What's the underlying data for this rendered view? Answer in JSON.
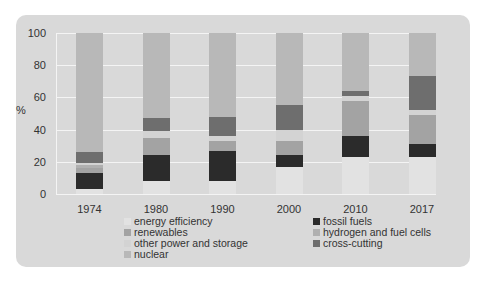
{
  "chart_data": {
    "type": "bar",
    "stacked": true,
    "title": "",
    "xlabel": "",
    "ylabel": "%",
    "ylim": [
      0,
      100
    ],
    "yticks": [
      "0",
      "20",
      "40",
      "60",
      "80",
      "100"
    ],
    "grid": true,
    "legend_position": "bottom",
    "categories": [
      "1974",
      "1980",
      "1990",
      "2000",
      "2010",
      "2017"
    ],
    "series": [
      {
        "name": "energy efficiency",
        "color": "#e2e2e2",
        "values": [
          3,
          8,
          8,
          17,
          23,
          23
        ]
      },
      {
        "name": "fossil fuels",
        "color": "#2b2b2b",
        "values": [
          10,
          16,
          19,
          7,
          13,
          8
        ]
      },
      {
        "name": "renewables",
        "color": "#a3a3a3",
        "values": [
          3,
          11,
          6,
          9,
          22,
          18
        ]
      },
      {
        "name": "hydrogen and fuel cells",
        "color": "#b0b0b0",
        "values": [
          2,
          0,
          0,
          0,
          0,
          0
        ]
      },
      {
        "name": "other power and storage",
        "color": "#d3d3d3",
        "values": [
          1,
          4,
          3,
          7,
          3,
          3
        ]
      },
      {
        "name": "cross-cutting",
        "color": "#6e6e6e",
        "values": [
          7,
          8,
          12,
          15,
          3,
          21
        ]
      },
      {
        "name": "nuclear",
        "color": "#b8b8b8",
        "values": [
          74,
          53,
          52,
          45,
          36,
          27
        ]
      }
    ]
  },
  "axis": {
    "ylabel": "%",
    "yticks": [
      "0",
      "20",
      "40",
      "60",
      "80",
      "100"
    ],
    "categories": [
      "1974",
      "1980",
      "1990",
      "2000",
      "2010",
      "2017"
    ]
  },
  "legend": {
    "left": [
      {
        "label": "energy efficiency",
        "color": "#e2e2e2"
      },
      {
        "label": "renewables",
        "color": "#a3a3a3"
      },
      {
        "label": "other power and storage",
        "color": "#d3d3d3"
      },
      {
        "label": "nuclear",
        "color": "#b8b8b8"
      }
    ],
    "right": [
      {
        "label": "fossil fuels",
        "color": "#2b2b2b"
      },
      {
        "label": "hydrogen and fuel cells",
        "color": "#b0b0b0"
      },
      {
        "label": "cross-cutting",
        "color": "#6e6e6e"
      }
    ]
  }
}
